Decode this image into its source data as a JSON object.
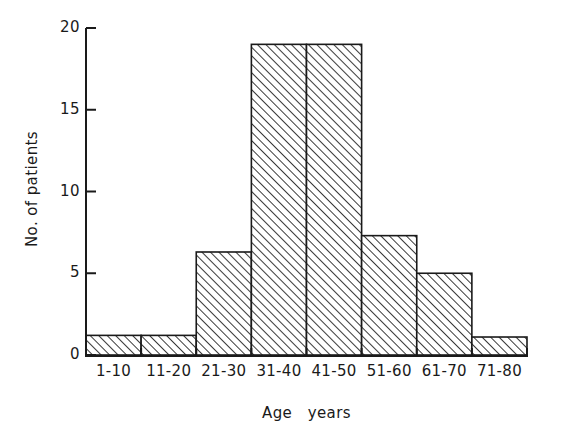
{
  "chart_data": {
    "type": "bar",
    "title": "",
    "subtitle": "",
    "xlabel": "Age   years",
    "ylabel": "No. of patients",
    "categories": [
      "1-10",
      "11-20",
      "21-30",
      "31-40",
      "41-50",
      "51-60",
      "61-70",
      "71-80"
    ],
    "values": [
      1.2,
      1.2,
      6.3,
      19,
      19,
      7.3,
      5.0,
      1.1
    ],
    "series": [
      {
        "name": "No. of patients",
        "values": [
          1.2,
          1.2,
          6.3,
          19,
          19,
          7.3,
          5.0,
          1.1
        ]
      }
    ],
    "ylim": [
      0,
      20
    ],
    "yticks": [
      0,
      5,
      10,
      15,
      20
    ],
    "ytick_labels": [
      "0",
      "5",
      "10",
      "15",
      "20"
    ],
    "xlim_bins": 8,
    "grid": false,
    "legend": false,
    "legend_position": "none",
    "bar_fill": "hatched-diagonal",
    "bar_edge_color": "#1a1a1a",
    "axis_color": "#1a1a1a",
    "background_color": "#ffffff",
    "annotations": []
  },
  "axes": {
    "y_ticks": [
      {
        "label": "20",
        "value": 20
      },
      {
        "label": "15",
        "value": 15
      },
      {
        "label": "10",
        "value": 10
      },
      {
        "label": "5",
        "value": 5
      },
      {
        "label": "0",
        "value": 0
      }
    ],
    "x_ticks": [
      {
        "label": "1-10"
      },
      {
        "label": "11-20"
      },
      {
        "label": "21-30"
      },
      {
        "label": "31-40"
      },
      {
        "label": "41-50"
      },
      {
        "label": "51-60"
      },
      {
        "label": "61-70"
      },
      {
        "label": "71-80"
      }
    ]
  }
}
